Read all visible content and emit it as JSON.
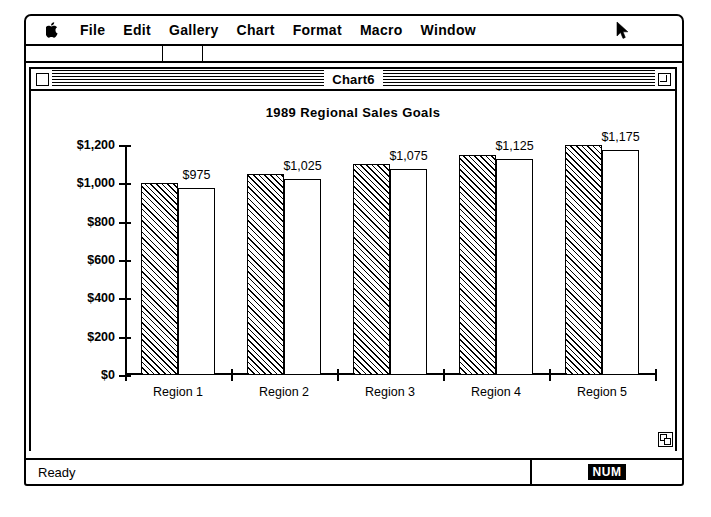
{
  "menu_bar": {
    "apple_icon": "apple-logo",
    "items": [
      {
        "label": "File"
      },
      {
        "label": "Edit"
      },
      {
        "label": "Gallery"
      },
      {
        "label": "Chart"
      },
      {
        "label": "Format"
      },
      {
        "label": "Macro"
      },
      {
        "label": "Window"
      }
    ],
    "cursor_icon": "arrow-pointer"
  },
  "document_window": {
    "title": "Chart6",
    "close_box_icon": "close-box-icon",
    "zoom_box_icon": "zoom-box-icon",
    "grow_box_icon": "grow-box-icon"
  },
  "status_bar": {
    "message": "Ready",
    "num_lock": "NUM"
  },
  "chart_data": {
    "type": "bar",
    "title": "1989 Regional Sales Goals",
    "xlabel": "",
    "ylabel": "",
    "categories": [
      "Region 1",
      "Region 2",
      "Region 3",
      "Region 4",
      "Region 5"
    ],
    "series": [
      {
        "name": "Goal",
        "fill": "diagonal-hatch",
        "values": [
          1000,
          1050,
          1100,
          1150,
          1200
        ]
      },
      {
        "name": "Actual",
        "fill": "white",
        "values": [
          975,
          1025,
          1075,
          1125,
          1175
        ]
      }
    ],
    "data_labels": [
      "$975",
      "$1,025",
      "$1,075",
      "$1,125",
      "$1,175"
    ],
    "ylim": [
      0,
      1200
    ],
    "ytick_values": [
      0,
      200,
      400,
      600,
      800,
      1000,
      1200
    ],
    "ytick_labels": [
      "$0",
      "$200",
      "$400",
      "$600",
      "$800",
      "$1,000",
      "$1,200"
    ],
    "grid": false,
    "legend": "none",
    "colors": {
      "axis": "#000000",
      "background": "#ffffff",
      "bar_outline": "#000000"
    }
  }
}
